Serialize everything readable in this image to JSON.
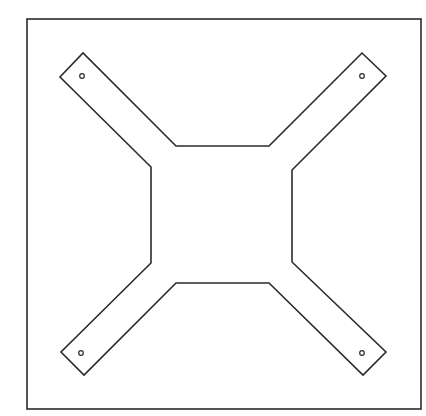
{
  "diagram": {
    "title": "",
    "colors": {
      "background": "#ffffff",
      "stroke": "#2b2b2b"
    },
    "stroke_width": 1.6,
    "frame": {
      "x": 27,
      "y": 19,
      "width": 394,
      "height": 390
    },
    "outline_points": "176,146 269,146 362,53 386,76 292,170 292,262 386,352 363,375 269,283 176,283 84,375 61,352 151,263 151,167 60,77 83,53",
    "holes": [
      {
        "name": "top-left",
        "cx": 82,
        "cy": 76,
        "r": 2.3
      },
      {
        "name": "top-right",
        "cx": 362,
        "cy": 76,
        "r": 2.3
      },
      {
        "name": "bottom-left",
        "cx": 81,
        "cy": 353,
        "r": 2.3
      },
      {
        "name": "bottom-right",
        "cx": 362,
        "cy": 353,
        "r": 2.3
      }
    ]
  }
}
